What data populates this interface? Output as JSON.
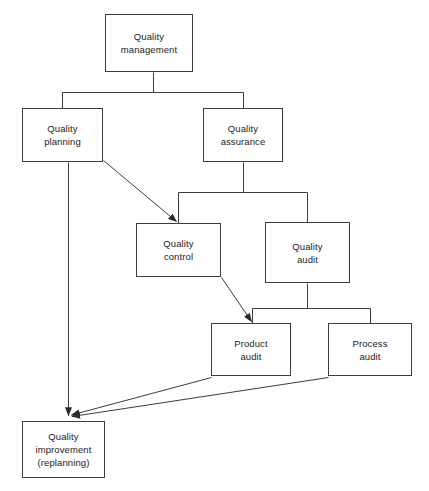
{
  "diagram": {
    "title_fragment": "",
    "line_color": "#3d3d3d",
    "text_color": "#1c1c1c",
    "background_color": "#ffffff",
    "nodes": [
      {
        "id": "quality-management",
        "label": "Quality\nmanagement",
        "x": 105,
        "y": 14,
        "w": 88,
        "h": 58
      },
      {
        "id": "quality-planning",
        "label": "Quality\nplanning",
        "x": 22,
        "y": 108,
        "w": 81,
        "h": 54
      },
      {
        "id": "quality-assurance",
        "label": "Quality\nassurance",
        "x": 203,
        "y": 108,
        "w": 80,
        "h": 54
      },
      {
        "id": "quality-control",
        "label": "Quality\ncontrol",
        "x": 136,
        "y": 223,
        "w": 85,
        "h": 54
      },
      {
        "id": "quality-audit",
        "label": "Quality\naudit",
        "x": 265,
        "y": 222,
        "w": 85,
        "h": 61
      },
      {
        "id": "product-audit",
        "label": "Product\naudit",
        "x": 211,
        "y": 323,
        "w": 80,
        "h": 53
      },
      {
        "id": "process-audit",
        "label": "Process\naudit",
        "x": 328,
        "y": 323,
        "w": 84,
        "h": 53
      },
      {
        "id": "quality-improvement",
        "label": "Quality\nimprovement\n(replanning)",
        "x": 22,
        "y": 421,
        "w": 83,
        "h": 57
      }
    ],
    "edges": [
      {
        "id": "management-to-planning",
        "type": "tree",
        "from": "quality-management",
        "to": "quality-planning"
      },
      {
        "id": "management-to-assurance",
        "type": "tree",
        "from": "quality-management",
        "to": "quality-assurance"
      },
      {
        "id": "assurance-to-control",
        "type": "tree",
        "from": "quality-assurance",
        "to": "quality-control"
      },
      {
        "id": "assurance-to-audit",
        "type": "tree",
        "from": "quality-assurance",
        "to": "quality-audit"
      },
      {
        "id": "audit-to-product-audit",
        "type": "tree",
        "from": "quality-audit",
        "to": "product-audit"
      },
      {
        "id": "audit-to-process-audit",
        "type": "tree",
        "from": "quality-audit",
        "to": "process-audit"
      },
      {
        "id": "planning-to-control",
        "type": "arrow",
        "from": "quality-planning",
        "to": "quality-control"
      },
      {
        "id": "control-to-product-audit",
        "type": "arrow",
        "from": "quality-control",
        "to": "product-audit"
      },
      {
        "id": "planning-to-improvement",
        "type": "arrow",
        "from": "quality-planning",
        "to": "quality-improvement"
      },
      {
        "id": "product-audit-to-improvement",
        "type": "arrow",
        "from": "product-audit",
        "to": "quality-improvement"
      },
      {
        "id": "process-audit-to-improvement",
        "type": "arrow",
        "from": "process-audit",
        "to": "quality-improvement"
      }
    ]
  }
}
